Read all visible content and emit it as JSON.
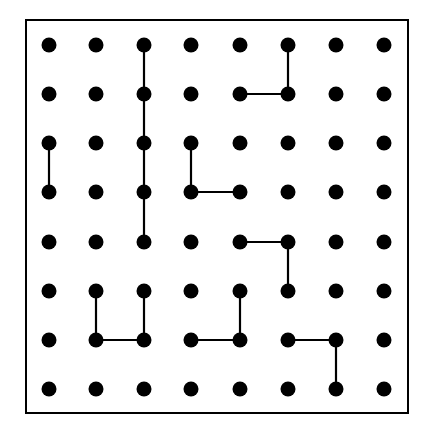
{
  "puzzle": {
    "type": "dot-grid",
    "columns": 8,
    "rows": 8,
    "colors": {
      "background": "#ffffff",
      "dot": "#000000",
      "line": "#000000",
      "border": "#000000"
    },
    "geometry": {
      "border": {
        "x": 26,
        "y": 20,
        "width": 382,
        "height": 393
      },
      "col_x": [
        49,
        96,
        144,
        191,
        240,
        288,
        336,
        384
      ],
      "row_y": [
        45,
        94,
        143,
        192,
        242,
        291,
        340,
        389
      ],
      "dot_radius": 7.5,
      "line_width": 2.2,
      "border_width": 2
    },
    "segments": [
      {
        "from": [
          2,
          0
        ],
        "to": [
          2,
          1
        ]
      },
      {
        "from": [
          2,
          1
        ],
        "to": [
          2,
          2
        ]
      },
      {
        "from": [
          2,
          2
        ],
        "to": [
          2,
          3
        ]
      },
      {
        "from": [
          2,
          3
        ],
        "to": [
          2,
          4
        ]
      },
      {
        "from": [
          5,
          0
        ],
        "to": [
          5,
          1
        ]
      },
      {
        "from": [
          4,
          1
        ],
        "to": [
          5,
          1
        ]
      },
      {
        "from": [
          0,
          2
        ],
        "to": [
          0,
          3
        ]
      },
      {
        "from": [
          3,
          2
        ],
        "to": [
          3,
          3
        ]
      },
      {
        "from": [
          3,
          3
        ],
        "to": [
          4,
          3
        ]
      },
      {
        "from": [
          4,
          4
        ],
        "to": [
          5,
          4
        ]
      },
      {
        "from": [
          5,
          4
        ],
        "to": [
          5,
          5
        ]
      },
      {
        "from": [
          1,
          5
        ],
        "to": [
          1,
          6
        ]
      },
      {
        "from": [
          1,
          6
        ],
        "to": [
          2,
          6
        ]
      },
      {
        "from": [
          2,
          5
        ],
        "to": [
          2,
          6
        ]
      },
      {
        "from": [
          4,
          5
        ],
        "to": [
          4,
          6
        ]
      },
      {
        "from": [
          3,
          6
        ],
        "to": [
          4,
          6
        ]
      },
      {
        "from": [
          5,
          6
        ],
        "to": [
          6,
          6
        ]
      },
      {
        "from": [
          6,
          6
        ],
        "to": [
          6,
          7
        ]
      }
    ],
    "shapes": [
      {
        "name": "vertical-line-col3",
        "points": [
          [
            2,
            0
          ],
          [
            2,
            1
          ],
          [
            2,
            2
          ],
          [
            2,
            3
          ],
          [
            2,
            4
          ]
        ]
      },
      {
        "name": "l-shape-top-right",
        "points": [
          [
            5,
            0
          ],
          [
            5,
            1
          ],
          [
            4,
            1
          ]
        ]
      },
      {
        "name": "short-vertical-left",
        "points": [
          [
            0,
            2
          ],
          [
            0,
            3
          ]
        ]
      },
      {
        "name": "l-shape-middle",
        "points": [
          [
            3,
            2
          ],
          [
            3,
            3
          ],
          [
            4,
            3
          ]
        ]
      },
      {
        "name": "l-shape-right-middle",
        "points": [
          [
            4,
            4
          ],
          [
            5,
            4
          ],
          [
            5,
            5
          ]
        ]
      },
      {
        "name": "u-shape-bottom-left",
        "points": [
          [
            1,
            5
          ],
          [
            1,
            6
          ],
          [
            2,
            6
          ],
          [
            2,
            5
          ]
        ]
      },
      {
        "name": "l-shape-bottom-middle",
        "points": [
          [
            4,
            5
          ],
          [
            4,
            6
          ],
          [
            3,
            6
          ]
        ]
      },
      {
        "name": "l-shape-bottom-right",
        "points": [
          [
            5,
            6
          ],
          [
            6,
            6
          ],
          [
            6,
            7
          ]
        ]
      }
    ]
  }
}
